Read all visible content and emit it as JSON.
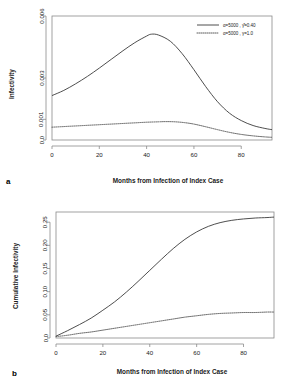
{
  "figure": {
    "panels": [
      {
        "letter": "a",
        "xlabel": "Months from Infection of Index Case",
        "ylabel": "Infectivity"
      },
      {
        "letter": "b",
        "xlabel": "Months from Infection of Index Case",
        "ylabel": "Cumulative Infectivity"
      }
    ]
  },
  "chart_data": [
    {
      "type": "line",
      "panel": "a",
      "title": "",
      "xlabel": "Months from Infection of Index Case",
      "ylabel": "Infectivity",
      "xlim": [
        0,
        93
      ],
      "ylim": [
        0,
        0.006
      ],
      "xticks": [
        0,
        20,
        40,
        60,
        80
      ],
      "xticklabels": [
        "0",
        "20",
        "40",
        "60",
        "80"
      ],
      "yticks": [
        0.0,
        0.001,
        0.003,
        0.006
      ],
      "yticklabels": [
        "0.0",
        "0.001",
        "0.003",
        "0.006"
      ],
      "grid": false,
      "legend_position": "top-right",
      "series": [
        {
          "name": "α=5000 , γ̂=0.40",
          "style": "solid",
          "x": [
            0,
            5,
            10,
            15,
            20,
            25,
            30,
            35,
            40,
            42,
            45,
            50,
            55,
            60,
            65,
            70,
            75,
            80,
            85,
            90,
            93
          ],
          "values": [
            0.00215,
            0.0024,
            0.00272,
            0.00308,
            0.00348,
            0.0039,
            0.00432,
            0.00471,
            0.00503,
            0.00512,
            0.00508,
            0.00478,
            0.00418,
            0.0034,
            0.00258,
            0.00185,
            0.0013,
            0.00094,
            0.0007,
            0.00056,
            0.0005
          ]
        },
        {
          "name": "α=5000 , γ=1.0",
          "style": "dotted",
          "x": [
            0,
            5,
            10,
            15,
            20,
            25,
            30,
            35,
            40,
            45,
            48,
            52,
            56,
            60,
            65,
            70,
            75,
            80,
            85,
            90,
            93
          ],
          "values": [
            0.00062,
            0.00065,
            0.00068,
            0.00071,
            0.00074,
            0.00077,
            0.0008,
            0.00083,
            0.00086,
            0.00088,
            0.00089,
            0.00088,
            0.00084,
            0.00077,
            0.00064,
            0.0005,
            0.00037,
            0.00027,
            0.0002,
            0.00015,
            0.00013
          ]
        }
      ]
    },
    {
      "type": "line",
      "panel": "b",
      "title": "",
      "xlabel": "Months from Infection of Index Case",
      "ylabel": "Cumulative Infectivity",
      "xlim": [
        0,
        93
      ],
      "ylim": [
        0,
        0.272
      ],
      "xticks": [
        0,
        20,
        40,
        60,
        80
      ],
      "xticklabels": [
        "0",
        "20",
        "40",
        "60",
        "80"
      ],
      "yticks": [
        0.0,
        0.05,
        0.1,
        0.15,
        0.2,
        0.25
      ],
      "yticklabels": [
        "0.0",
        "0.05",
        "0.10",
        "0.15",
        "0.20",
        "0.25"
      ],
      "grid": false,
      "legend_position": "none",
      "series": [
        {
          "name": "α=5000 , γ̂=0.40",
          "style": "solid",
          "x": [
            0,
            5,
            10,
            15,
            20,
            25,
            30,
            35,
            40,
            45,
            50,
            55,
            60,
            65,
            70,
            75,
            80,
            85,
            90,
            93
          ],
          "values": [
            0.004,
            0.016,
            0.029,
            0.043,
            0.06,
            0.078,
            0.099,
            0.122,
            0.146,
            0.17,
            0.193,
            0.213,
            0.229,
            0.241,
            0.249,
            0.254,
            0.257,
            0.259,
            0.26,
            0.261
          ]
        },
        {
          "name": "α=5000 , γ=1.0",
          "style": "dotted",
          "x": [
            0,
            5,
            10,
            15,
            20,
            25,
            30,
            35,
            40,
            45,
            50,
            55,
            60,
            65,
            70,
            75,
            80,
            85,
            90,
            93
          ],
          "values": [
            0.003,
            0.006,
            0.01,
            0.013,
            0.017,
            0.021,
            0.025,
            0.029,
            0.033,
            0.037,
            0.041,
            0.045,
            0.048,
            0.051,
            0.053,
            0.054,
            0.055,
            0.055,
            0.056,
            0.056
          ]
        }
      ]
    }
  ]
}
